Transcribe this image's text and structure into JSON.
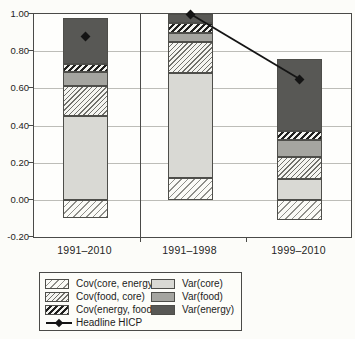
{
  "chart_data": {
    "type": "bar",
    "stacked": true,
    "grid": true,
    "categories": [
      "1991–2010",
      "1991–1998",
      "1999–2010"
    ],
    "series": [
      {
        "name": "Cov(core, energy)",
        "style": "hatch-light",
        "values": [
          -0.1,
          0.12,
          -0.11
        ]
      },
      {
        "name": "Var(core)",
        "style": "solid-light",
        "values": [
          0.45,
          0.56,
          0.11
        ]
      },
      {
        "name": "Cov(food, core)",
        "style": "hatch-med",
        "values": [
          0.16,
          0.17,
          0.12
        ]
      },
      {
        "name": "Var(food)",
        "style": "solid-med",
        "values": [
          0.08,
          0.05,
          0.09
        ]
      },
      {
        "name": "Cov(energy, food)",
        "style": "hatch-dense",
        "values": [
          0.04,
          0.05,
          0.05
        ]
      },
      {
        "name": "Var(energy)",
        "style": "solid-dark",
        "values": [
          0.25,
          0.05,
          0.39
        ]
      }
    ],
    "overlay": {
      "name": "Headline HICP",
      "marker": "filled-diamond",
      "values": [
        0.88,
        1.0,
        0.65
      ],
      "connected_category_indices": [
        1,
        2
      ]
    },
    "ylim": [
      -0.2,
      1.0
    ],
    "ytick_step": 0.2,
    "panel_divider_after_category_index": 0,
    "legend_position": "bottom-left-boxed",
    "colors": {
      "solid-light": "#d9d9d4",
      "solid-med": "#a5a5a0",
      "solid-dark": "#585855",
      "line": "#141414",
      "gridline": "#bdbdb8",
      "frame": "#4a4a48"
    }
  },
  "y_axis": {
    "labels": [
      "1.00",
      "0.80",
      "0.60",
      "0.40",
      "0.20",
      "0.00",
      "-0.20"
    ]
  },
  "x_axis": {
    "labels": [
      "1991–2010",
      "1991–1998",
      "1999–2010"
    ]
  },
  "legend": {
    "col1": [
      {
        "id": "cov-core-energy",
        "label": "Cov(core, energy)",
        "style": "hatch-light"
      },
      {
        "id": "cov-food-core",
        "label": "Cov(food, core)",
        "style": "hatch-med"
      },
      {
        "id": "cov-energy-food",
        "label": "Cov(energy, food)",
        "style": "hatch-dense"
      },
      {
        "id": "headline-hicp",
        "label": "Headline HICP",
        "style": "marker-line"
      }
    ],
    "col2": [
      {
        "id": "var-core",
        "label": "Var(core)",
        "style": "solid-light"
      },
      {
        "id": "var-food",
        "label": "Var(food)",
        "style": "solid-med"
      },
      {
        "id": "var-energy",
        "label": "Var(energy)",
        "style": "solid-dark"
      }
    ]
  }
}
